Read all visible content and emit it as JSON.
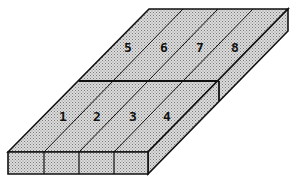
{
  "diagram": {
    "title": "",
    "fill_color": "#c8c8c8",
    "edge_color": "#111111",
    "front_sections": [
      {
        "label": "1",
        "x": 63,
        "y": 117
      },
      {
        "label": "2",
        "x": 97,
        "y": 117
      },
      {
        "label": "3",
        "x": 133,
        "y": 117
      },
      {
        "label": "4",
        "x": 167,
        "y": 117
      }
    ],
    "back_sections": [
      {
        "label": "5",
        "x": 128,
        "y": 48
      },
      {
        "label": "6",
        "x": 164,
        "y": 48
      },
      {
        "label": "7",
        "x": 200,
        "y": 48
      },
      {
        "label": "8",
        "x": 235,
        "y": 48
      }
    ]
  }
}
